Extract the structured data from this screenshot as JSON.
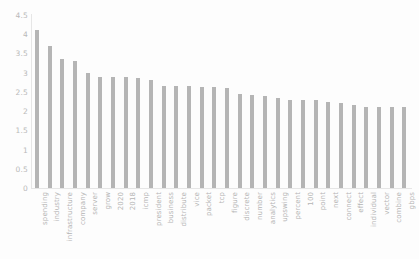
{
  "chart_data": {
    "type": "bar",
    "title": "",
    "xlabel": "",
    "ylabel": "",
    "ylim": [
      0,
      4.5
    ],
    "yticks": [
      "0",
      "0.5",
      "1",
      "1.5",
      "2",
      "2.5",
      "3",
      "3.5",
      "4",
      "4.5"
    ],
    "grid": false,
    "legend": null,
    "bar_color": "#b5b5b5",
    "background_color": "#fdfdfd",
    "tick_label_color": "#b4b4b4",
    "categories": [
      "spending",
      "industry",
      "infrastructure",
      "company",
      "server",
      "grow",
      "2020",
      "2018",
      "icmp",
      "president",
      "business",
      "distribute",
      "vice",
      "packet",
      "tcp",
      "figure",
      "discrete",
      "number",
      "analytics",
      "upswing",
      "percent",
      "100",
      "point",
      "next",
      "connect",
      "effect",
      "individual",
      "vector",
      "combine",
      "gbps"
    ],
    "values": [
      4.1,
      3.7,
      3.35,
      3.3,
      3.0,
      2.9,
      2.9,
      2.88,
      2.85,
      2.8,
      2.65,
      2.65,
      2.65,
      2.63,
      2.62,
      2.6,
      2.45,
      2.42,
      2.4,
      2.35,
      2.3,
      2.3,
      2.28,
      2.25,
      2.2,
      2.15,
      2.12,
      2.1,
      2.1,
      2.1
    ]
  }
}
